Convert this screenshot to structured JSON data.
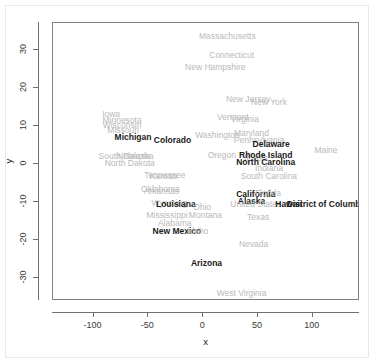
{
  "chart_data": {
    "type": "scatter",
    "title": "",
    "xlabel": "x",
    "ylabel": "y",
    "xlim": [
      -137,
      143
    ],
    "ylim": [
      -36,
      37
    ],
    "xticks": [
      -100,
      -50,
      0,
      50,
      100
    ],
    "yticks": [
      30,
      20,
      10,
      0,
      -10,
      -20,
      -30
    ],
    "xtick_labels": [
      "-100",
      "-50",
      "0",
      "50",
      "100"
    ],
    "ytick_labels": [
      "30",
      "20",
      "10",
      "0",
      "-10",
      "-20",
      "-30"
    ],
    "grid": false,
    "legend": null,
    "label_colors": {
      "highlighted": "#1a1a1a",
      "muted": "#b9b9b9"
    },
    "points": [
      {
        "label": "Massachusetts",
        "x": 22,
        "y": 33.5,
        "highlight": false
      },
      {
        "label": "Connecticut",
        "x": 26,
        "y": 28.5,
        "highlight": false
      },
      {
        "label": "New Hampshire",
        "x": 11,
        "y": 25.5,
        "highlight": false
      },
      {
        "label": "New Jersey",
        "x": 41,
        "y": 17.0,
        "highlight": false
      },
      {
        "label": "New York",
        "x": 60,
        "y": 16.2,
        "highlight": false
      },
      {
        "label": "Vermont",
        "x": 27,
        "y": 12.4,
        "highlight": false
      },
      {
        "label": "Virginia",
        "x": 38,
        "y": 11.8,
        "highlight": false
      },
      {
        "label": "Iowa",
        "x": -84,
        "y": 13.2,
        "highlight": false
      },
      {
        "label": "Minnesota",
        "x": -74,
        "y": 11.6,
        "highlight": false
      },
      {
        "label": "Wisconsin",
        "x": -74,
        "y": 10.3,
        "highlight": false
      },
      {
        "label": "Missouri",
        "x": -73,
        "y": 9.0,
        "highlight": false
      },
      {
        "label": "Washington",
        "x": 13,
        "y": 7.6,
        "highlight": false
      },
      {
        "label": "Maryland",
        "x": 44,
        "y": 8.0,
        "highlight": false
      },
      {
        "label": "Pennsylvania",
        "x": 51,
        "y": 6.2,
        "highlight": false
      },
      {
        "label": "Michigan",
        "x": -64,
        "y": 7.0,
        "highlight": true
      },
      {
        "label": "Colorado",
        "x": -28,
        "y": 6.4,
        "highlight": true
      },
      {
        "label": "Delaware",
        "x": 62,
        "y": 5.2,
        "highlight": true
      },
      {
        "label": "Oregon",
        "x": 17,
        "y": 2.4,
        "highlight": false
      },
      {
        "label": "Illinois",
        "x": 48,
        "y": 1.6,
        "highlight": false
      },
      {
        "label": "Rhode Island",
        "x": 57,
        "y": 2.4,
        "highlight": true
      },
      {
        "label": "North Carolina",
        "x": 57,
        "y": 0.4,
        "highlight": true
      },
      {
        "label": "Indiana",
        "x": 60,
        "y": -1.0,
        "highlight": false
      },
      {
        "label": "Maine",
        "x": 112,
        "y": 3.6,
        "highlight": false
      },
      {
        "label": "South Dakota",
        "x": -72,
        "y": 2.0,
        "highlight": false
      },
      {
        "label": "Nebraska",
        "x": -62,
        "y": 2.0,
        "highlight": false
      },
      {
        "label": "North Dakota",
        "x": -67,
        "y": 0.3,
        "highlight": false
      },
      {
        "label": "South Carolina",
        "x": 60,
        "y": -3.2,
        "highlight": false
      },
      {
        "label": "Tennessee",
        "x": -35,
        "y": -3.0,
        "highlight": false
      },
      {
        "label": "Kansas",
        "x": -36,
        "y": -3.2,
        "highlight": false
      },
      {
        "label": "Oklahoma",
        "x": -39,
        "y": -6.6,
        "highlight": false
      },
      {
        "label": "Arkansas",
        "x": -38,
        "y": -7.0,
        "highlight": false
      },
      {
        "label": "California",
        "x": 48,
        "y": -7.8,
        "highlight": true
      },
      {
        "label": "Florida",
        "x": 59,
        "y": -7.6,
        "highlight": false
      },
      {
        "label": "Alaska",
        "x": 44,
        "y": -9.7,
        "highlight": true
      },
      {
        "label": "United States",
        "x": 48,
        "y": -10.4,
        "highlight": false
      },
      {
        "label": "Hawaii",
        "x": 78,
        "y": -10.6,
        "highlight": true
      },
      {
        "label": "District of Columbia",
        "x": 113,
        "y": -10.6,
        "highlight": true
      },
      {
        "label": "Wyoming",
        "x": -31,
        "y": -10.2,
        "highlight": false
      },
      {
        "label": "Louisiana",
        "x": -25,
        "y": -10.6,
        "highlight": true
      },
      {
        "label": "Ohio",
        "x": -1,
        "y": -11.4,
        "highlight": false
      },
      {
        "label": "Montana",
        "x": 2,
        "y": -13.4,
        "highlight": false
      },
      {
        "label": "Mississippi",
        "x": -33,
        "y": -13.4,
        "highlight": false
      },
      {
        "label": "Alabama",
        "x": -26,
        "y": -15.6,
        "highlight": false
      },
      {
        "label": "Texas",
        "x": 50,
        "y": -14.0,
        "highlight": false
      },
      {
        "label": "New Mexico",
        "x": -24,
        "y": -17.6,
        "highlight": true
      },
      {
        "label": "Idaho",
        "x": -5,
        "y": -17.6,
        "highlight": false
      },
      {
        "label": "Nevada",
        "x": 46,
        "y": -21.0,
        "highlight": false
      },
      {
        "label": "Arizona",
        "x": 3,
        "y": -26.0,
        "highlight": true
      },
      {
        "label": "West Virginia",
        "x": 35,
        "y": -34.0,
        "highlight": false
      }
    ]
  }
}
